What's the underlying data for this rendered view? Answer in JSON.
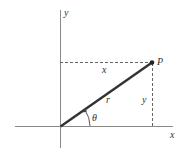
{
  "diagram": {
    "colors": {
      "axis": "#8a8a8a",
      "radius": "#333333",
      "dashed": "#555555",
      "text": "#333333",
      "point": "#222222"
    },
    "axes": {
      "x_label": "x",
      "y_label": "y"
    },
    "point": {
      "label": "P"
    },
    "segments": {
      "horizontal_label": "x",
      "vertical_label": "y",
      "radius_label": "r"
    },
    "angle": {
      "label": "θ"
    }
  }
}
